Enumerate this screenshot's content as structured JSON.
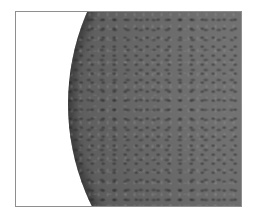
{
  "image": {
    "description": "Close-up rendering of a large gray sphere with bumpy, dimpled surface texture, partially visible from the right inside a thin gray frame",
    "frame_color": "#8e8e8e",
    "background_color": "#ffffff",
    "sphere_color": "#6e6e6e",
    "sphere_edge_color": "#2a2a2a"
  }
}
